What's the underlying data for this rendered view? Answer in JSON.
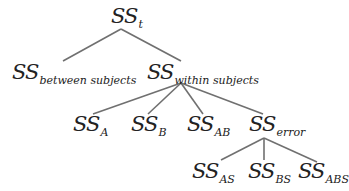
{
  "diagram": {
    "type": "tree",
    "line_color": "#707070",
    "nodes": {
      "root": {
        "base": "SS",
        "sub": "t"
      },
      "between": {
        "base": "SS",
        "sub": "between subjects"
      },
      "within": {
        "base": "SS",
        "sub": "within subjects"
      },
      "a": {
        "base": "SS",
        "sub": "A"
      },
      "b": {
        "base": "SS",
        "sub": "B"
      },
      "ab": {
        "base": "SS",
        "sub": "AB"
      },
      "error": {
        "base": "SS",
        "sub": "error"
      },
      "as": {
        "base": "SS",
        "sub": "AS"
      },
      "bs": {
        "base": "SS",
        "sub": "BS"
      },
      "abs": {
        "base": "SS",
        "sub": "ABS"
      }
    },
    "edges": [
      [
        "root",
        "between"
      ],
      [
        "root",
        "within"
      ],
      [
        "within",
        "a"
      ],
      [
        "within",
        "b"
      ],
      [
        "within",
        "ab"
      ],
      [
        "within",
        "error"
      ],
      [
        "error",
        "as"
      ],
      [
        "error",
        "bs"
      ],
      [
        "error",
        "abs"
      ]
    ]
  }
}
